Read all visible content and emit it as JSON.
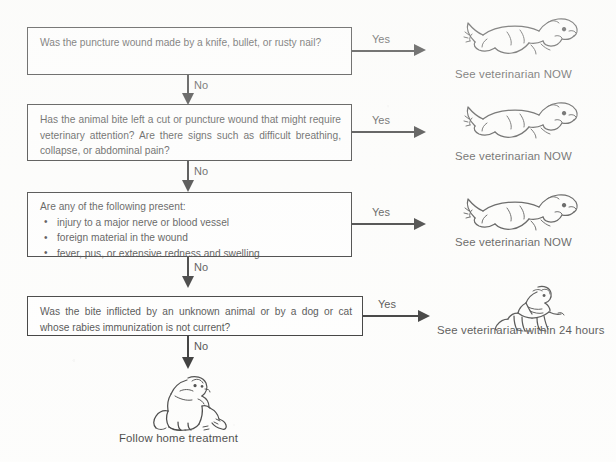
{
  "document": {
    "title": "Animal bite and puncture wound triage flowchart",
    "background_color": "#fdfdfc",
    "ink_color": "#1b1b1b"
  },
  "nodes": [
    {
      "id": "q1",
      "type": "decision",
      "text": "Was the puncture wound made by a knife, bullet, or rusty nail?"
    },
    {
      "id": "q2",
      "type": "decision",
      "text": "Has the animal bite left a cut or puncture wound that might require veterinary attention? Are there signs such as difficult breathing, collapse, or abdominal pain?"
    },
    {
      "id": "q3",
      "type": "decision",
      "lead": "Are any of the following present:",
      "bullets": [
        "injury to a major nerve or blood vessel",
        "foreign material in the wound",
        "fever, pus, or extensive redness and swelling"
      ]
    },
    {
      "id": "q4",
      "type": "decision",
      "text": "Was the bite inflicted by an unknown animal or by a dog or cat whose rabies immunization is not current?"
    }
  ],
  "edges": {
    "yes_1": "Yes",
    "yes_2": "Yes",
    "yes_3": "Yes",
    "yes_4": "Yes",
    "no_1": "No",
    "no_2": "No",
    "no_3": "No",
    "no_4": "No"
  },
  "outcomes": [
    {
      "id": "out1",
      "label": "See veterinarian NOW",
      "illustration": "running-dog-icon"
    },
    {
      "id": "out2",
      "label": "See veterinarian NOW",
      "illustration": "running-dog-icon"
    },
    {
      "id": "out3",
      "label": "See veterinarian NOW",
      "illustration": "running-dog-icon"
    },
    {
      "id": "out4",
      "label": "See veterinarian within 24 hours",
      "illustration": "person-carrying-dog-icon"
    },
    {
      "id": "out5",
      "label": "Follow home treatment",
      "illustration": "sitting-dog-icon"
    }
  ]
}
